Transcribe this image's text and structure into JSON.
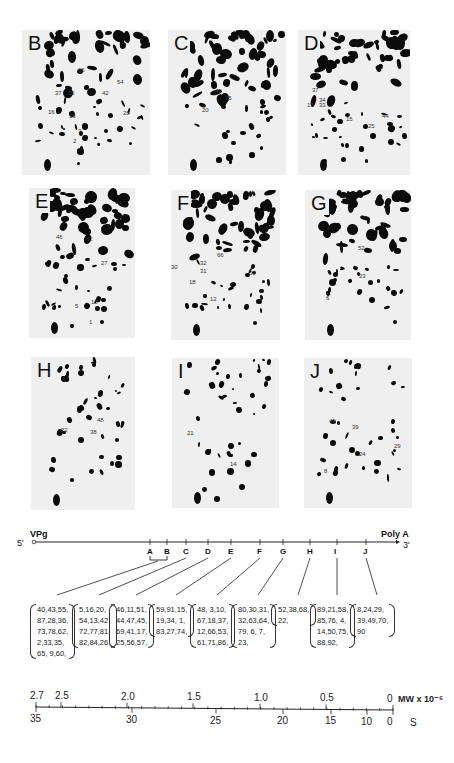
{
  "gels": [
    {
      "letter": "B",
      "x": 22,
      "y": 30,
      "w": 128,
      "h": 145,
      "labels": [
        {
          "t": "65",
          "x": 56,
          "y": 37
        },
        {
          "t": "54",
          "x": 95,
          "y": 49
        },
        {
          "t": "37",
          "x": 33,
          "y": 60
        },
        {
          "t": "55",
          "x": 46,
          "y": 60
        },
        {
          "t": "42",
          "x": 80,
          "y": 60
        },
        {
          "t": "16",
          "x": 26,
          "y": 79
        },
        {
          "t": "28",
          "x": 101,
          "y": 80
        },
        {
          "t": "13",
          "x": 47,
          "y": 83
        },
        {
          "t": "3",
          "x": 56,
          "y": 98
        },
        {
          "t": "2",
          "x": 51,
          "y": 108
        }
      ]
    },
    {
      "letter": "C",
      "x": 168,
      "y": 30,
      "w": 118,
      "h": 145,
      "labels": [
        {
          "t": "40",
          "x": 47,
          "y": 58
        },
        {
          "t": "35",
          "x": 57,
          "y": 65
        },
        {
          "t": "20",
          "x": 34,
          "y": 77
        }
      ]
    },
    {
      "letter": "D",
      "x": 298,
      "y": 30,
      "w": 112,
      "h": 145,
      "labels": [
        {
          "t": "37",
          "x": 14,
          "y": 57
        },
        {
          "t": "34",
          "x": 21,
          "y": 67
        },
        {
          "t": "17",
          "x": 9,
          "y": 72
        },
        {
          "t": "33",
          "x": 21,
          "y": 72
        },
        {
          "t": "44",
          "x": 84,
          "y": 83
        },
        {
          "t": "15",
          "x": 48,
          "y": 86
        },
        {
          "t": "25",
          "x": 70,
          "y": 93
        }
      ]
    },
    {
      "letter": "E",
      "x": 29,
      "y": 188,
      "w": 106,
      "h": 150,
      "labels": [
        {
          "t": "46",
          "x": 27,
          "y": 46
        },
        {
          "t": "62",
          "x": 57,
          "y": 48
        },
        {
          "t": "27",
          "x": 72,
          "y": 72
        },
        {
          "t": "5",
          "x": 46,
          "y": 115
        },
        {
          "t": "10",
          "x": 62,
          "y": 111
        },
        {
          "t": "1",
          "x": 60,
          "y": 131
        }
      ]
    },
    {
      "letter": "F",
      "x": 171,
      "y": 190,
      "w": 109,
      "h": 150,
      "labels": [
        {
          "t": "32",
          "x": 29,
          "y": 70
        },
        {
          "t": "30",
          "x": 0,
          "y": 74
        },
        {
          "t": "31",
          "x": 29,
          "y": 78
        },
        {
          "t": "66",
          "x": 46,
          "y": 62
        },
        {
          "t": "53",
          "x": 78,
          "y": 80
        },
        {
          "t": "18",
          "x": 18,
          "y": 89
        },
        {
          "t": "12",
          "x": 39,
          "y": 106
        }
      ]
    },
    {
      "letter": "G",
      "x": 305,
      "y": 190,
      "w": 106,
      "h": 150,
      "labels": [
        {
          "t": "52",
          "x": 53,
          "y": 55
        },
        {
          "t": "23",
          "x": 54,
          "y": 83
        },
        {
          "t": "6",
          "x": 21,
          "y": 105
        }
      ]
    },
    {
      "letter": "H",
      "x": 31,
      "y": 357,
      "w": 104,
      "h": 153,
      "labels": [
        {
          "t": "48",
          "x": 66,
          "y": 60
        },
        {
          "t": "22",
          "x": 30,
          "y": 70
        },
        {
          "t": "38",
          "x": 59,
          "y": 72
        }
      ]
    },
    {
      "letter": "I",
      "x": 172,
      "y": 358,
      "w": 107,
      "h": 150,
      "labels": [
        {
          "t": "21",
          "x": 15,
          "y": 72
        },
        {
          "t": "14",
          "x": 58,
          "y": 103
        }
      ]
    },
    {
      "letter": "J",
      "x": 304,
      "y": 358,
      "w": 108,
      "h": 150,
      "labels": [
        {
          "t": "49",
          "x": 25,
          "y": 60
        },
        {
          "t": "39",
          "x": 48,
          "y": 66
        },
        {
          "t": "29",
          "x": 90,
          "y": 85
        },
        {
          "t": "24",
          "x": 55,
          "y": 93
        },
        {
          "t": "8",
          "x": 20,
          "y": 110
        }
      ]
    }
  ],
  "genome_map": {
    "five_prime": "5'",
    "vpg": "VPg",
    "poly_a": "Poly A",
    "three_prime": "3'",
    "markers": [
      {
        "label": "A",
        "x": 150
      },
      {
        "label": "B",
        "x": 167
      },
      {
        "label": "C",
        "x": 186
      },
      {
        "label": "D",
        "x": 208
      },
      {
        "label": "E",
        "x": 231
      },
      {
        "label": "F",
        "x": 260
      },
      {
        "label": "G",
        "x": 283
      },
      {
        "label": "H",
        "x": 310
      },
      {
        "label": "I",
        "x": 337
      },
      {
        "label": "J",
        "x": 366
      }
    ]
  },
  "spot_lists": [
    {
      "group": "A-B",
      "x": 37,
      "lines": [
        "40,43,55,",
        "87,28,36,",
        "73,78,62,",
        "2,33,35,",
        "65,  9,60,"
      ]
    },
    {
      "group": "C",
      "x": 79,
      "lines": [
        "5,16,20,",
        "54,13,42,",
        "72,77,81,",
        "82,84,26,"
      ]
    },
    {
      "group": "D",
      "x": 116,
      "lines": [
        "46,11,51,",
        "44,47,45,",
        "69,41,17,",
        "25,56,57,"
      ]
    },
    {
      "group": "E",
      "x": 156,
      "lines": [
        "59,91,15,",
        "19,34,  1,",
        "83,27,74,"
      ]
    },
    {
      "group": "F",
      "x": 197,
      "lines": [
        "48,  3,10,",
        "67,18,37,",
        "12,66,53,",
        "61,71,86,"
      ]
    },
    {
      "group": "G",
      "x": 238,
      "lines": [
        "80,30,31,",
        "32,63,64,",
        "79,  6,  7,",
        "23,"
      ]
    },
    {
      "group": "H",
      "x": 278,
      "lines": [
        "52,38,68,",
        "22,"
      ]
    },
    {
      "group": "I",
      "x": 317,
      "lines": [
        "89,21,58,",
        "85,76,  4,",
        "14,50,75,",
        "88,92,"
      ]
    },
    {
      "group": "J",
      "x": 357,
      "lines": [
        "8,24,29,",
        "39,49,70,",
        "90"
      ]
    }
  ],
  "scale": {
    "mw_label": "MW x 10⁻⁶",
    "s_label": "S",
    "mw_ticks": [
      {
        "v": "2.7",
        "x": 36
      },
      {
        "v": "2.5",
        "x": 61
      },
      {
        "v": "2.0",
        "x": 127
      },
      {
        "v": "1.5",
        "x": 193
      },
      {
        "v": "1.0",
        "x": 260
      },
      {
        "v": "0.5",
        "x": 326
      },
      {
        "v": "0",
        "x": 393
      }
    ],
    "s_ticks": [
      {
        "v": "35",
        "x": 36
      },
      {
        "v": "30",
        "x": 132
      },
      {
        "v": "25",
        "x": 216
      },
      {
        "v": "20",
        "x": 283
      },
      {
        "v": "15",
        "x": 331
      },
      {
        "v": "10",
        "x": 367
      },
      {
        "v": "0",
        "x": 393
      }
    ]
  }
}
